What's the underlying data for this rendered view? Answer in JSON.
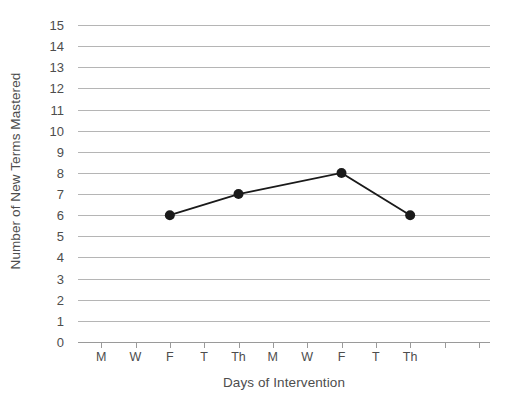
{
  "chart_data": {
    "type": "line",
    "title": "",
    "xlabel": "Days of Intervention",
    "ylabel": "Number of New Terms Mastered",
    "ylim": [
      0,
      15
    ],
    "y_ticks": [
      0,
      1,
      2,
      3,
      4,
      5,
      6,
      7,
      8,
      9,
      10,
      11,
      12,
      13,
      14,
      15
    ],
    "x_tick_labels": [
      "M",
      "W",
      "F",
      "T",
      "Th",
      "M",
      "W",
      "F",
      "T",
      "Th",
      "",
      ""
    ],
    "x_tick_count": 12,
    "grid": "horizontal",
    "legend": "none",
    "series": [
      {
        "name": "New Terms Mastered",
        "x_indices": [
          2,
          4,
          7,
          9
        ],
        "x_labels": [
          "F",
          "Th",
          "F",
          "Th"
        ],
        "values": [
          6,
          7,
          8,
          6
        ],
        "marker": "circle",
        "line_color": "#1a1a1a",
        "marker_color": "#1a1a1a"
      }
    ],
    "colors": {
      "gridline": "#b5b5b5",
      "axis": "#9a9a9a",
      "text": "#4d4d4d",
      "series": "#1a1a1a",
      "background": "#ffffff"
    }
  }
}
